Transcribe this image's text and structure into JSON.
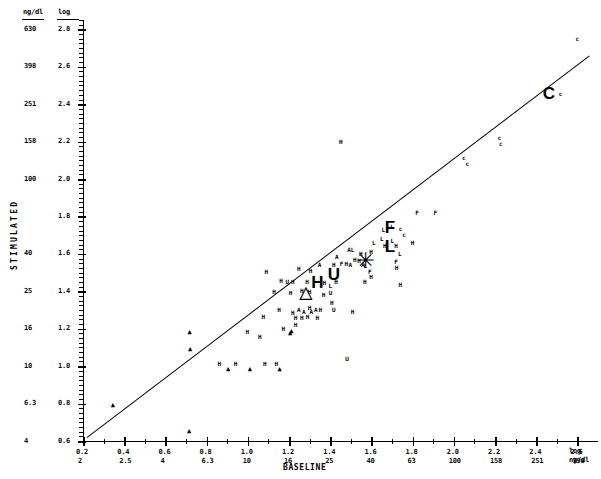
{
  "chart_data": {
    "type": "scatter",
    "title": "",
    "xlabel": "BASELINE",
    "ylabel": "STIMULATED",
    "x_unit_top": "log",
    "x_unit_bottom": "ng/dl",
    "y_unit_left": "ng/dl",
    "y_unit_right": "log",
    "xlim": [
      0.2,
      2.7
    ],
    "ylim": [
      0.6,
      2.85
    ],
    "grid": false,
    "legend": "none",
    "x_ticks_log": [
      "0.2",
      "0.4",
      "0.6",
      "0.8",
      "1.0",
      "1.2",
      "1.4",
      "1.6",
      "1.8",
      "2.0",
      "2.2",
      "2.4",
      "2.6"
    ],
    "x_ticks_ngdl": [
      "2",
      "2.5",
      "4",
      "6.3",
      "10",
      "16",
      "25",
      "40",
      "63",
      "100",
      "158",
      "251",
      "398"
    ],
    "y_ticks_log": [
      "2.8",
      "2.6",
      "2.4",
      "2.2",
      "2.0",
      "1.8",
      "1.6",
      "1.4",
      "1.2",
      "1.0",
      "0.8",
      "0.6"
    ],
    "y_ticks_ngdl": [
      "630",
      "398",
      "251",
      "158",
      "100",
      "",
      "40",
      "25",
      "16",
      "10",
      "6.3",
      "4"
    ],
    "fit_line": {
      "x0": 0.22,
      "y0": 0.62,
      "x1": 2.66,
      "y1": 2.66
    },
    "marker_codes": [
      "H",
      "L",
      "F",
      "A",
      "U",
      "C",
      "triangle",
      "star"
    ],
    "points": [
      {
        "m": "triangle",
        "x": 0.345,
        "y": 0.795
      },
      {
        "m": "triangle",
        "x": 0.715,
        "y": 0.655
      },
      {
        "m": "triangle",
        "x": 0.72,
        "y": 1.093
      },
      {
        "m": "triangle",
        "x": 0.718,
        "y": 1.18
      },
      {
        "m": "triangle",
        "x": 0.905,
        "y": 0.985
      },
      {
        "m": "triangle",
        "x": 1.01,
        "y": 0.985
      },
      {
        "m": "triangle",
        "x": 1.155,
        "y": 0.985
      },
      {
        "m": "triangle",
        "x": 1.212,
        "y": 1.188
      },
      {
        "m": "triangle",
        "x": 1.205,
        "y": 1.175
      },
      {
        "m": "H",
        "x": 0.862,
        "y": 1.01
      },
      {
        "m": "H",
        "x": 0.94,
        "y": 1.012
      },
      {
        "m": "H",
        "x": 1.082,
        "y": 1.01
      },
      {
        "m": "H",
        "x": 1.138,
        "y": 1.012
      },
      {
        "m": "H",
        "x": 1.172,
        "y": 1.2
      },
      {
        "m": "H",
        "x": 1.075,
        "y": 1.265
      },
      {
        "m": "H",
        "x": 1.152,
        "y": 1.3
      },
      {
        "m": "H",
        "x": 1.218,
        "y": 1.285
      },
      {
        "m": "H",
        "x": 1.232,
        "y": 1.255
      },
      {
        "m": "H",
        "x": 1.262,
        "y": 1.258
      },
      {
        "m": "H",
        "x": 1.29,
        "y": 1.262
      },
      {
        "m": "H",
        "x": 1.3,
        "y": 1.31
      },
      {
        "m": "A",
        "x": 1.248,
        "y": 1.3
      },
      {
        "m": "A",
        "x": 1.272,
        "y": 1.288
      },
      {
        "m": "A",
        "x": 1.308,
        "y": 1.292
      },
      {
        "m": "A",
        "x": 1.33,
        "y": 1.3
      },
      {
        "m": "H",
        "x": 1.352,
        "y": 1.3
      },
      {
        "m": "H",
        "x": 1.338,
        "y": 1.258
      },
      {
        "m": "H",
        "x": 1.128,
        "y": 1.395
      },
      {
        "m": "H",
        "x": 1.208,
        "y": 1.392
      },
      {
        "m": "H",
        "x": 1.262,
        "y": 1.402
      },
      {
        "m": "H",
        "x": 1.3,
        "y": 1.398
      },
      {
        "m": "H",
        "x": 1.368,
        "y": 1.38
      },
      {
        "m": "H",
        "x": 1.408,
        "y": 1.34
      },
      {
        "m": "H",
        "x": 1.162,
        "y": 1.455
      },
      {
        "m": "H",
        "x": 1.218,
        "y": 1.45
      },
      {
        "m": "U",
        "x": 1.192,
        "y": 1.45
      },
      {
        "m": "H",
        "x": 1.288,
        "y": 1.452
      },
      {
        "m": "H",
        "x": 1.372,
        "y": 1.445
      },
      {
        "m": "L",
        "x": 1.4,
        "y": 1.43
      },
      {
        "m": "H",
        "x": 1.428,
        "y": 1.452
      },
      {
        "m": "U",
        "x": 1.402,
        "y": 1.39
      },
      {
        "m": "H",
        "x": 1.09,
        "y": 1.505
      },
      {
        "m": "H",
        "x": 1.248,
        "y": 1.52
      },
      {
        "m": "H",
        "x": 1.305,
        "y": 1.51
      },
      {
        "m": "A",
        "x": 1.348,
        "y": 1.54
      },
      {
        "m": "H",
        "x": 1.418,
        "y": 1.538
      },
      {
        "m": "F",
        "x": 1.455,
        "y": 1.545
      },
      {
        "m": "H",
        "x": 1.478,
        "y": 1.548
      },
      {
        "m": "A",
        "x": 1.498,
        "y": 1.54
      },
      {
        "m": "A",
        "x": 1.432,
        "y": 1.582
      },
      {
        "m": "H",
        "x": 1.52,
        "y": 1.568
      },
      {
        "m": "H",
        "x": 1.54,
        "y": 1.56
      },
      {
        "m": "A",
        "x": 1.558,
        "y": 1.538
      },
      {
        "m": "L",
        "x": 1.57,
        "y": 1.535
      },
      {
        "m": "F",
        "x": 1.592,
        "y": 1.505
      },
      {
        "m": "H",
        "x": 1.598,
        "y": 1.478
      },
      {
        "m": "H",
        "x": 1.568,
        "y": 1.452
      },
      {
        "m": "A",
        "x": 1.492,
        "y": 1.622
      },
      {
        "m": "L",
        "x": 1.508,
        "y": 1.62
      },
      {
        "m": "H",
        "x": 1.548,
        "y": 1.6
      },
      {
        "m": "H",
        "x": 1.598,
        "y": 1.612
      },
      {
        "m": "L",
        "x": 1.612,
        "y": 1.658
      },
      {
        "m": "L",
        "x": 1.65,
        "y": 1.682
      },
      {
        "m": "H",
        "x": 1.665,
        "y": 1.64
      },
      {
        "m": "L",
        "x": 1.702,
        "y": 1.668
      },
      {
        "m": "H",
        "x": 1.72,
        "y": 1.64
      },
      {
        "m": "L",
        "x": 1.658,
        "y": 1.728
      },
      {
        "m": "L",
        "x": 1.7,
        "y": 1.742
      },
      {
        "m": "c",
        "x": 1.742,
        "y": 1.735
      },
      {
        "m": "c",
        "x": 1.758,
        "y": 1.702
      },
      {
        "m": "L",
        "x": 1.738,
        "y": 1.6
      },
      {
        "m": "F",
        "x": 1.72,
        "y": 1.558
      },
      {
        "m": "H",
        "x": 1.722,
        "y": 1.522
      },
      {
        "m": "H",
        "x": 1.8,
        "y": 1.658
      },
      {
        "m": "F",
        "x": 1.822,
        "y": 1.82
      },
      {
        "m": "F",
        "x": 1.91,
        "y": 1.818
      },
      {
        "m": "c",
        "x": 2.048,
        "y": 2.11
      },
      {
        "m": "c",
        "x": 2.065,
        "y": 2.082
      },
      {
        "m": "c",
        "x": 2.222,
        "y": 2.218
      },
      {
        "m": "c",
        "x": 2.228,
        "y": 2.188
      },
      {
        "m": "c",
        "x": 2.518,
        "y": 2.452
      },
      {
        "m": "c",
        "x": 2.6,
        "y": 2.748
      },
      {
        "m": "H",
        "x": 1.452,
        "y": 2.2
      },
      {
        "m": "H",
        "x": 1.232,
        "y": 1.218
      },
      {
        "m": "H",
        "x": 1.058,
        "y": 1.155
      },
      {
        "m": "H",
        "x": 0.998,
        "y": 1.185
      },
      {
        "m": "H",
        "x": 1.508,
        "y": 1.288
      },
      {
        "m": "H",
        "x": 1.74,
        "y": 1.432
      },
      {
        "m": "U",
        "x": 1.482,
        "y": 1.038
      },
      {
        "m": "U",
        "x": 1.418,
        "y": 1.298
      }
    ],
    "big_markers": [
      {
        "m": "H",
        "x": 1.338,
        "y": 1.452
      },
      {
        "m": "U",
        "x": 1.418,
        "y": 1.495
      },
      {
        "m": "triangle",
        "x": 1.282,
        "y": 1.398
      },
      {
        "m": "star",
        "x": 1.572,
        "y": 1.562
      },
      {
        "m": "F",
        "x": 1.69,
        "y": 1.742
      },
      {
        "m": "L",
        "x": 1.69,
        "y": 1.64
      },
      {
        "m": "C",
        "x": 2.462,
        "y": 2.462
      }
    ]
  },
  "axes": {
    "y_header_left": "ng/dl",
    "y_header_right": "log",
    "x_footer_left": "log",
    "x_footer_right": "ng/dl",
    "x_title": "BASELINE",
    "y_title": "STIMULATED"
  }
}
